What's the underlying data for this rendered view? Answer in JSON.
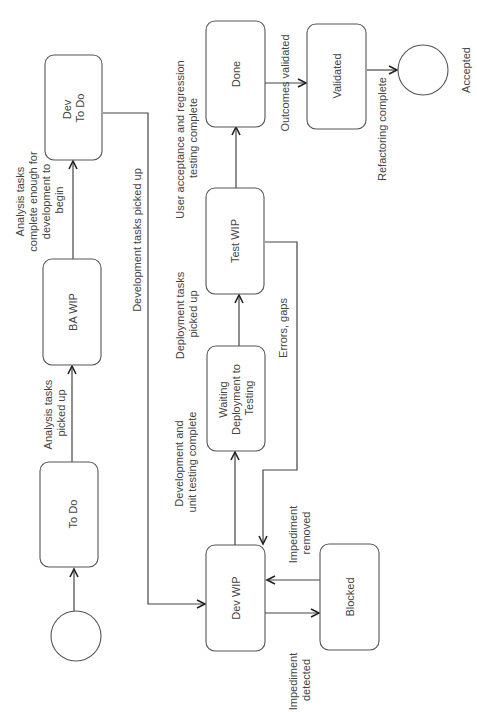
{
  "diagram": {
    "type": "state-flow",
    "orientation": "rotated-90-ccw",
    "nodes": {
      "start": {
        "label": ""
      },
      "todo": {
        "label": "To Do"
      },
      "ba_wip": {
        "label": "BA WIP"
      },
      "dev_todo": {
        "label_line1": "Dev",
        "label_line2": "To Do"
      },
      "dev_wip": {
        "label": "Dev WIP"
      },
      "blocked": {
        "label": "Blocked"
      },
      "waiting": {
        "label_line1": "Waiting",
        "label_line2": "Deployment to",
        "label_line3": "Testing"
      },
      "test_wip": {
        "label": "Test WIP"
      },
      "done": {
        "label": "Done"
      },
      "validated": {
        "label": "Validated"
      },
      "accepted": {
        "label": "Accepted"
      }
    },
    "edges": {
      "start_todo": {
        "label": ""
      },
      "todo_ba": {
        "line1": "Analysis tasks",
        "line2": "picked up"
      },
      "ba_devtodo": {
        "line1": "Analysis tasks",
        "line2": "complete enough for",
        "line3": "development to",
        "line4": "begin"
      },
      "devtodo_devwip": {
        "label": "Development tasks picked up"
      },
      "devwip_waiting": {
        "line1": "Development and",
        "line2": "unit testing complete"
      },
      "waiting_test": {
        "line1": "Deployment tasks",
        "line2": "picked up"
      },
      "test_done": {
        "line1": "User acceptance and regression",
        "line2": "testing complete"
      },
      "test_devwip": {
        "label": "Errors, gaps"
      },
      "devwip_blocked": {
        "line1": "Impediment",
        "line2": "detected"
      },
      "blocked_devwip": {
        "line1": "Impediment",
        "line2": "removed"
      },
      "done_validated": {
        "label": "Outcomes validated"
      },
      "validated_accepted": {
        "label": "Refactoring complete"
      }
    }
  }
}
